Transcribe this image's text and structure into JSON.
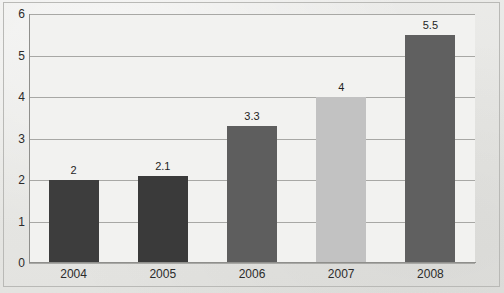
{
  "chart_data": {
    "type": "bar",
    "title": "",
    "subtitle": "",
    "xlabel": "",
    "ylabel": "",
    "categories": [
      "2004",
      "2005",
      "2006",
      "2007",
      "2008"
    ],
    "values": [
      2,
      2.1,
      3.3,
      4,
      5.5
    ],
    "data_labels": [
      "2",
      "2.1",
      "3.3",
      "4",
      "5.5"
    ],
    "ylim": [
      0,
      6
    ],
    "ytick_labels": [
      "0",
      "1",
      "2",
      "3",
      "4",
      "5",
      "6"
    ],
    "ytick_values": [
      0,
      1,
      2,
      3,
      4,
      5,
      6
    ],
    "grid": true,
    "grid_axis": "y",
    "legend": false,
    "legend_position": "none",
    "bar_colors": [
      "#3d3d3d",
      "#3a3a3a",
      "#5e5e5e",
      "#c2c2c2",
      "#606060"
    ],
    "series": [
      {
        "name": "",
        "values": [
          2,
          2.1,
          3.3,
          4,
          5.5
        ]
      }
    ]
  },
  "style": {
    "page_background": "#e9e9e7",
    "plot_background": "#f2f2f0",
    "gridline_color": "#a8a8a5",
    "axis_color": "#8f8f8c",
    "frame_color": "#b9b9b6",
    "text_color": "#2b2b2b"
  }
}
